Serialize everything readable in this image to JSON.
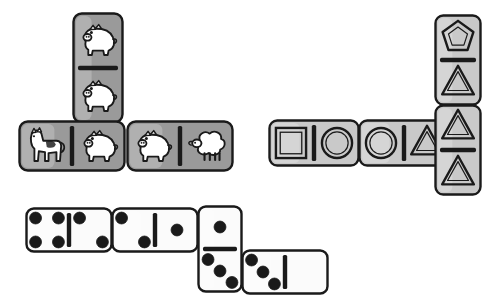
{
  "scene": {
    "title": "Domino tiles illustration",
    "background_color": "#ffffff",
    "ink_color": "#1a1a1a",
    "tile_gray_dark": "#9a9a9a",
    "tile_gray_light": "#c9c9c9",
    "tile_white": "#fbfbfb",
    "pip_color": "#1a1a1a"
  },
  "groups": [
    {
      "name": "animal-dominoes",
      "tiles": [
        {
          "id": "animal-vertical-top",
          "orientation": "vertical",
          "fill": "#9a9a9a",
          "x": 72,
          "y": 12,
          "w": 52,
          "h": 112,
          "halves": [
            "pig",
            "pig"
          ]
        },
        {
          "id": "animal-horizontal-left",
          "orientation": "horizontal",
          "fill": "#9a9a9a",
          "x": 18,
          "y": 120,
          "w": 108,
          "h": 52,
          "halves": [
            "horse",
            "pig"
          ]
        },
        {
          "id": "animal-horizontal-right",
          "orientation": "horizontal",
          "fill": "#9a9a9a",
          "x": 126,
          "y": 120,
          "w": 108,
          "h": 52,
          "halves": [
            "pig",
            "sheep"
          ]
        }
      ]
    },
    {
      "name": "shape-dominoes",
      "tiles": [
        {
          "id": "shape-horizontal-left",
          "orientation": "horizontal",
          "fill": "#c9c9c9",
          "x": 268,
          "y": 119,
          "w": 92,
          "h": 48,
          "halves": [
            "square",
            "circle"
          ]
        },
        {
          "id": "shape-horizontal-right",
          "orientation": "horizontal",
          "fill": "#c9c9c9",
          "x": 358,
          "y": 119,
          "w": 92,
          "h": 48,
          "halves": [
            "circle",
            "triangle"
          ]
        },
        {
          "id": "shape-vertical-top",
          "orientation": "vertical",
          "fill": "#c9c9c9",
          "x": 434,
          "y": 14,
          "w": 48,
          "h": 92,
          "halves": [
            "pentagon",
            "triangle"
          ]
        },
        {
          "id": "shape-vertical-bottom",
          "orientation": "vertical",
          "fill": "#c9c9c9",
          "x": 434,
          "y": 104,
          "w": 48,
          "h": 92,
          "halves": [
            "triangle",
            "triangle"
          ]
        }
      ]
    },
    {
      "name": "pip-dominoes",
      "tiles": [
        {
          "id": "pip-horizontal-1",
          "orientation": "horizontal",
          "fill": "#fbfbfb",
          "x": 25,
          "y": 207,
          "w": 88,
          "h": 46,
          "pips": [
            4,
            2
          ]
        },
        {
          "id": "pip-horizontal-2",
          "orientation": "horizontal",
          "fill": "#fbfbfb",
          "x": 111,
          "y": 207,
          "w": 88,
          "h": 46,
          "pips": [
            2,
            1
          ]
        },
        {
          "id": "pip-vertical-3",
          "orientation": "vertical",
          "fill": "#fbfbfb",
          "x": 197,
          "y": 205,
          "w": 46,
          "h": 88,
          "pips": [
            1,
            3
          ]
        },
        {
          "id": "pip-horizontal-4",
          "orientation": "horizontal",
          "fill": "#fbfbfb",
          "x": 241,
          "y": 249,
          "w": 88,
          "h": 46,
          "pips": [
            3,
            0
          ]
        }
      ]
    }
  ]
}
